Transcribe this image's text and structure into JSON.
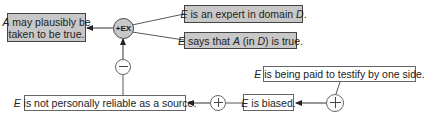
{
  "diagram": {
    "type": "argument-map",
    "conclusion": {
      "id": "conclusion",
      "parts": [
        {
          "t": "A",
          "i": true
        },
        {
          "t": " may plausibly be",
          "i": false
        }
      ],
      "line2": "taken to be true.",
      "fill": "#c8c8c8"
    },
    "scheme_node": {
      "label": "+EX",
      "fill": "#c8c8c8"
    },
    "premises": [
      {
        "id": "premise-expert",
        "parts": [
          {
            "t": "E",
            "i": true
          },
          {
            "t": " is an expert in domain ",
            "i": false
          },
          {
            "t": "D",
            "i": true
          },
          {
            "t": ".",
            "i": false
          }
        ]
      },
      {
        "id": "premise-says",
        "parts": [
          {
            "t": "E",
            "i": true
          },
          {
            "t": " says that ",
            "i": false
          },
          {
            "t": "A",
            "i": true
          },
          {
            "t": " (in ",
            "i": false
          },
          {
            "t": "D",
            "i": true
          },
          {
            "t": ") is true.",
            "i": false
          }
        ]
      }
    ],
    "attack_node": {
      "label": "−",
      "kind": "con"
    },
    "not_reliable": {
      "parts": [
        {
          "t": "E",
          "i": true
        },
        {
          "t": " is not personally reliable as a source.",
          "i": false
        }
      ]
    },
    "support_node_1": {
      "label": "+",
      "kind": "pro"
    },
    "biased": {
      "parts": [
        {
          "t": "E",
          "i": true
        },
        {
          "t": " is biased.",
          "i": false
        }
      ]
    },
    "support_node_2": {
      "label": "+",
      "kind": "pro"
    },
    "paid": {
      "parts": [
        {
          "t": "E",
          "i": true
        },
        {
          "t": " is being paid to testify by one side.",
          "i": false
        }
      ]
    },
    "colors": {
      "node_fill": "#c8c8c8",
      "line": "#444444",
      "background": "#ffffff"
    }
  }
}
